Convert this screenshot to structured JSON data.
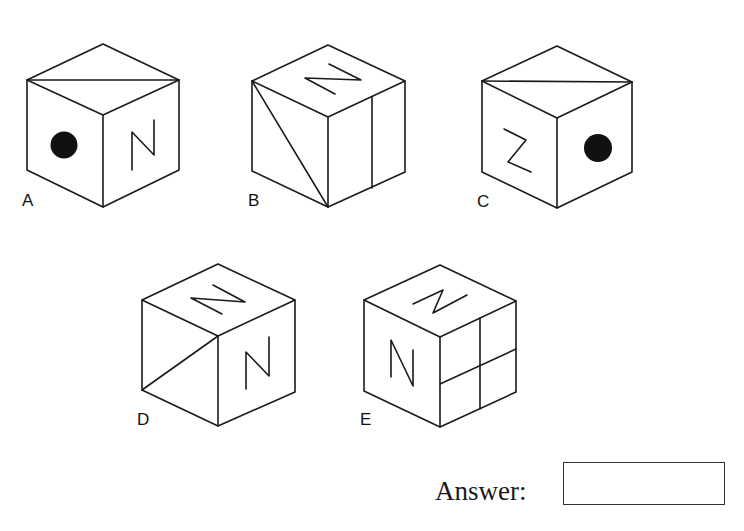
{
  "question": {
    "type": "cube-net-odd-one-out",
    "options": [
      {
        "label": "A",
        "top_face": "diagonal-line",
        "left_face": "dot",
        "right_face": "N"
      },
      {
        "label": "B",
        "top_face": "N",
        "left_face": "diagonal-line",
        "right_face": "vertical-line"
      },
      {
        "label": "C",
        "top_face": "diagonal-line",
        "left_face": "Z",
        "right_face": "dot"
      },
      {
        "label": "D",
        "top_face": "N",
        "left_face": "diagonal-line",
        "right_face": "N"
      },
      {
        "label": "E",
        "top_face": "N",
        "left_face": "N",
        "right_face": "cross-lines"
      }
    ]
  },
  "answer": {
    "label": "Answer:",
    "value": ""
  },
  "colors": {
    "stroke": "#1a1a1a",
    "background": "#ffffff"
  }
}
